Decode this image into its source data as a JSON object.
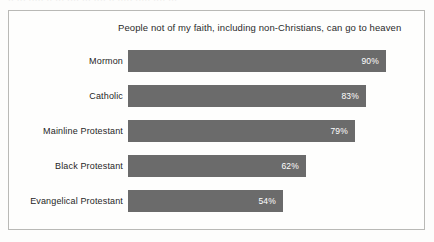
{
  "top_remnant": "·· ··· ····· ·· ··· ···· ··· ···· ·· ····· ····· ···· ···",
  "chart_data": {
    "type": "bar",
    "orientation": "horizontal",
    "title": "People not of my faith, including non-Christians, can go to heaven",
    "xlabel": "",
    "ylabel": "",
    "xlim": [
      0,
      100
    ],
    "grid": false,
    "legend": false,
    "value_suffix": "%",
    "bar_color": "#6b6b6b",
    "value_label_color": "#ffffff",
    "categories": [
      "Mormon",
      "Catholic",
      "Mainline Protestant",
      "Black Protestant",
      "Evangelical Protestant"
    ],
    "values": [
      90,
      83,
      79,
      62,
      54
    ],
    "value_labels": [
      "90%",
      "83%",
      "79%",
      "62%",
      "54%"
    ]
  }
}
